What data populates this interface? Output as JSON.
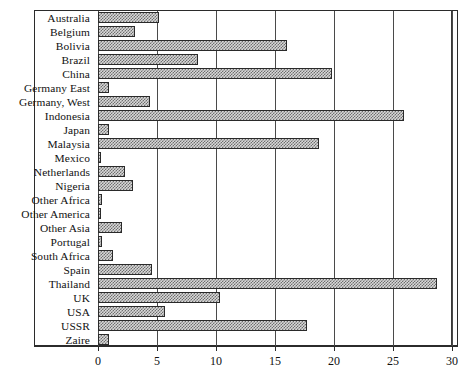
{
  "chart_data": {
    "type": "bar",
    "orientation": "horizontal",
    "title": "",
    "subtitle": "",
    "xlabel": "",
    "ylabel": "",
    "xlim": [
      0,
      30
    ],
    "ylim": null,
    "grid": true,
    "grid_axis": "x",
    "legend": false,
    "legend_position": "none",
    "xticks": [
      0,
      5,
      10,
      15,
      20,
      25,
      30
    ],
    "xtick_labels": [
      "0",
      "5",
      "10",
      "15",
      "20",
      "25",
      "30"
    ],
    "categories": [
      "Australia",
      "Belgium",
      "Bolivia",
      "Brazil",
      "China",
      "Germany  East",
      "Germany, West",
      "Indonesia",
      "Japan",
      "Malaysia",
      "Mexico",
      "Netherlands",
      "Nigeria",
      "Other Africa",
      "Other America",
      "Other Asia",
      "Portugal",
      "South Africa",
      "Spain",
      "Thailand",
      "UK",
      "USA",
      "USSR",
      "Zaire"
    ],
    "values": [
      5.2,
      3.1,
      16.0,
      8.5,
      19.8,
      0.9,
      4.4,
      25.9,
      0.9,
      18.7,
      0.2,
      2.3,
      3.0,
      0.3,
      0.1,
      2.0,
      0.3,
      1.3,
      4.6,
      28.7,
      10.3,
      5.7,
      17.7,
      0.9
    ],
    "series": [
      {
        "name": "value",
        "values": [
          5.2,
          3.1,
          16.0,
          8.5,
          19.8,
          0.9,
          4.4,
          25.9,
          0.9,
          18.7,
          0.2,
          2.3,
          3.0,
          0.3,
          0.1,
          2.0,
          0.3,
          1.3,
          4.6,
          28.7,
          10.3,
          5.7,
          17.7,
          0.9
        ]
      }
    ],
    "colors": {
      "bar_fill": "#d8d8d8",
      "bar_pattern": "#6e6e6e",
      "bar_edge": "#2a2a2a",
      "grid": "#4a4a4a",
      "frame": "#2b2b2b",
      "text": "#111111",
      "background": "#ffffff"
    }
  }
}
